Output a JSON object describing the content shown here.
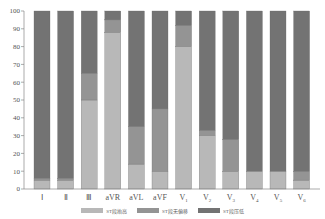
{
  "chart_data": {
    "type": "bar",
    "stacked": true,
    "title": "",
    "xlabel": "",
    "ylabel": "",
    "ylim": [
      0,
      100
    ],
    "yticks": [
      0,
      10,
      20,
      30,
      40,
      50,
      60,
      70,
      80,
      90,
      100
    ],
    "grid": false,
    "legend_position": "bottom",
    "categories": [
      "Ⅰ",
      "Ⅱ",
      "Ⅲ",
      "aVR",
      "aVL",
      "aVF",
      "V1",
      "V2",
      "V3",
      "V4",
      "V5",
      "V6"
    ],
    "series": [
      {
        "name": "ST段抬高",
        "color": "#b8b8b8",
        "values": [
          5,
          5,
          50,
          88,
          14,
          10,
          80,
          30,
          10,
          10,
          10,
          5
        ]
      },
      {
        "name": "ST段无偏移",
        "color": "#949494",
        "values": [
          1,
          1,
          15,
          7,
          21,
          35,
          12,
          3,
          18,
          0,
          0,
          5
        ]
      },
      {
        "name": "ST段压低",
        "color": "#737373",
        "values": [
          94,
          94,
          35,
          5,
          65,
          55,
          8,
          67,
          72,
          90,
          90,
          90
        ]
      }
    ]
  },
  "legend": {
    "items": [
      {
        "label": "ST段抬高",
        "color": "#b8b8b8"
      },
      {
        "label": "ST段无偏移",
        "color": "#949494"
      },
      {
        "label": "ST段压低",
        "color": "#737373"
      }
    ]
  }
}
